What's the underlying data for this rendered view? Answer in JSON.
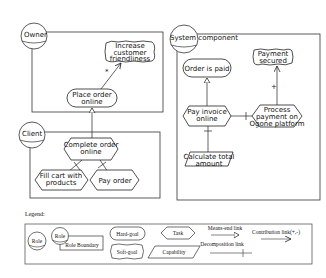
{
  "actors": {
    "owner": {
      "label": "Owner"
    },
    "client": {
      "label": "Client"
    },
    "system": {
      "label": "System component"
    }
  },
  "elements": {
    "increase_friendliness": {
      "type": "soft-goal",
      "line1": "Increase",
      "line2": "customer",
      "line3": "friendliness"
    },
    "place_order": {
      "type": "hard-goal",
      "line1": "Place order",
      "line2": "online"
    },
    "complete_order": {
      "type": "task",
      "line1": "Complete order",
      "line2": "online"
    },
    "fill_cart": {
      "type": "task",
      "line1": "Fill cart with",
      "line2": "products"
    },
    "pay_order": {
      "type": "task",
      "line1": "Pay order"
    },
    "order_paid": {
      "type": "hard-goal",
      "line1": "Order is paid"
    },
    "payment_secured": {
      "type": "soft-goal",
      "line1": "Payment",
      "line2": "secured"
    },
    "pay_invoice": {
      "type": "task",
      "line1": "Pay invoice",
      "line2": "online"
    },
    "process_payment": {
      "type": "task",
      "line1": "Process",
      "line2": "payment on",
      "line3": "Ogone platform"
    },
    "calculate_total": {
      "type": "capability",
      "line1": "Calculate total",
      "line2": "amount"
    }
  },
  "links": {
    "place_to_increase": {
      "type": "contribution",
      "label": "*"
    },
    "process_to_secured": {
      "type": "contribution",
      "label": "+"
    }
  },
  "legend": {
    "title": "Legend:",
    "role": "Role",
    "role2": "Role",
    "role_boundary": "Role Boundary",
    "hard_goal": "Hard-goal",
    "soft_goal": "Soft-goal",
    "task": "Task",
    "capability": "Capability",
    "means_end": "Means-end link",
    "decomposition": "Decomposition link",
    "contribution": "Contribution link(+,-)"
  }
}
